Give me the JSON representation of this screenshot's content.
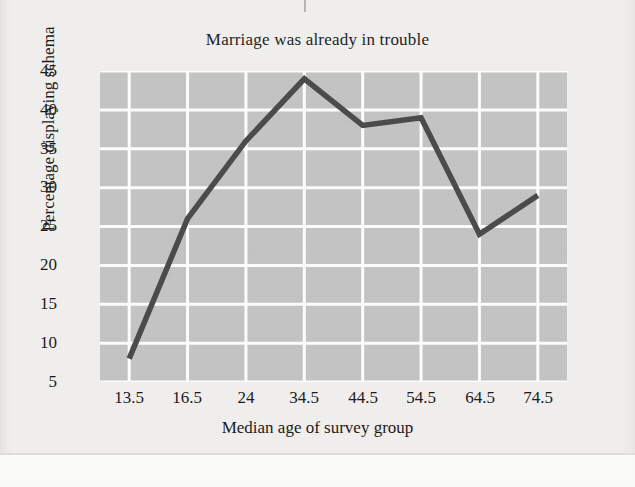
{
  "chart_data": {
    "type": "line",
    "title": "Marriage was already in trouble",
    "xlabel": "Median age of survey group",
    "ylabel": "Percentage displaying schema",
    "categories": [
      "13.5",
      "16.5",
      "24",
      "34.5",
      "44.5",
      "54.5",
      "64.5",
      "74.5"
    ],
    "values": [
      8,
      26,
      36,
      44,
      38,
      39,
      24,
      29
    ],
    "series": [
      {
        "name": "Percentage displaying schema",
        "values": [
          8,
          26,
          36,
          44,
          38,
          39,
          24,
          29
        ]
      }
    ],
    "ylim": [
      5,
      45
    ],
    "yticks": [
      "45",
      "40",
      "35",
      "30",
      "25",
      "20",
      "15",
      "10",
      "5"
    ],
    "ytick_values": [
      45,
      40,
      35,
      30,
      25,
      20,
      15,
      10,
      5
    ],
    "grid": true,
    "legend": false,
    "legend_position": "none",
    "plot_background_color": "#c4c4c4",
    "gridline_color": "#ffffff",
    "line_color": "#4a4a4a",
    "page_background_color": "#f2f1ef",
    "text_color": "#191817"
  }
}
